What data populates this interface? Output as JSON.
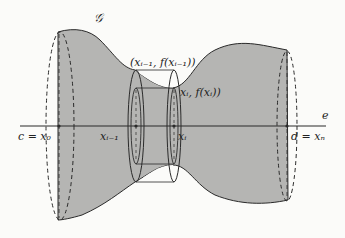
{
  "diagram": {
    "type": "solid-of-revolution",
    "colors": {
      "fill": "#b5b5b3",
      "stroke": "#2a2a2a",
      "background": "#fbfbf9",
      "hole": "#fbfbf9"
    },
    "labels": {
      "curve": "𝒢",
      "axis": "e",
      "left_end": "c = x₀",
      "right_end": "d = xₙ",
      "x_prev": "xᵢ₋₁",
      "x_curr": "xᵢ",
      "point_prev": "(xᵢ₋₁, f(xᵢ₋₁))",
      "point_curr": "xᵢ, f(xᵢ))"
    }
  }
}
